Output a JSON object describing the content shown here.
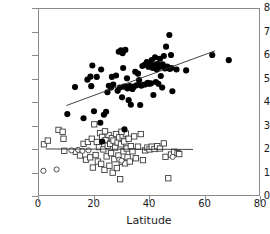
{
  "chart_data": {
    "type": "scatter",
    "title": "",
    "xlabel": "Latitude",
    "ylabel": "Ln (Torpor bout duration, h)",
    "xlim": [
      0,
      80
    ],
    "ylim": [
      0,
      8
    ],
    "xticks": [
      0,
      20,
      40,
      60,
      80
    ],
    "yticks": [
      0,
      1,
      2,
      3,
      4,
      5,
      6,
      7,
      8
    ],
    "grid": false,
    "legend": "none",
    "series": [
      {
        "name": "filled-circles",
        "marker": "filled-circle",
        "color": "#000000",
        "points": [
          [
            10.3,
            3.48
          ],
          [
            13.1,
            4.64
          ],
          [
            16.2,
            3.3
          ],
          [
            17.6,
            4.96
          ],
          [
            18.7,
            5.09
          ],
          [
            19.0,
            4.68
          ],
          [
            19.4,
            5.57
          ],
          [
            20.0,
            3.6
          ],
          [
            21.0,
            5.08
          ],
          [
            22.3,
            3.11
          ],
          [
            23.6,
            3.45
          ],
          [
            24.4,
            3.58
          ],
          [
            24.9,
            4.42
          ],
          [
            25.4,
            4.7
          ],
          [
            26.2,
            4.62
          ],
          [
            27.0,
            4.75
          ],
          [
            28.0,
            5.14
          ],
          [
            28.6,
            4.48
          ],
          [
            29.0,
            6.16
          ],
          [
            29.4,
            4.62
          ],
          [
            29.8,
            6.22
          ],
          [
            30.2,
            4.2
          ],
          [
            30.4,
            6.1
          ],
          [
            30.6,
            5.46
          ],
          [
            30.9,
            4.66
          ],
          [
            31.1,
            2.82
          ],
          [
            31.4,
            6.24
          ],
          [
            31.8,
            4.65
          ],
          [
            32.0,
            5.02
          ],
          [
            32.2,
            4.58
          ],
          [
            32.6,
            4.08
          ],
          [
            33.0,
            4.69
          ],
          [
            33.5,
            4.6
          ],
          [
            34.0,
            4.56
          ],
          [
            34.5,
            4.66
          ],
          [
            35.0,
            5.3
          ],
          [
            35.5,
            4.72
          ],
          [
            36.0,
            5.22
          ],
          [
            36.4,
            4.94
          ],
          [
            36.8,
            3.87
          ],
          [
            37.2,
            4.7
          ],
          [
            37.6,
            5.55
          ],
          [
            38.0,
            4.74
          ],
          [
            38.4,
            5.6
          ],
          [
            38.8,
            4.76
          ],
          [
            39.2,
            5.72
          ],
          [
            39.5,
            4.82
          ],
          [
            39.8,
            5.52
          ],
          [
            40.1,
            4.78
          ],
          [
            40.4,
            5.66
          ],
          [
            40.7,
            4.8
          ],
          [
            41.0,
            5.8
          ],
          [
            41.3,
            5.46
          ],
          [
            41.6,
            4.3
          ],
          [
            41.9,
            5.58
          ],
          [
            42.2,
            5.92
          ],
          [
            42.5,
            4.86
          ],
          [
            42.8,
            5.4
          ],
          [
            43.1,
            5.64
          ],
          [
            43.4,
            4.78
          ],
          [
            43.7,
            5.5
          ],
          [
            44.0,
            5.86
          ],
          [
            44.3,
            5.12
          ],
          [
            44.6,
            5.56
          ],
          [
            45.0,
            5.62
          ],
          [
            45.4,
            5.98
          ],
          [
            45.8,
            5.44
          ],
          [
            46.2,
            6.38
          ],
          [
            46.6,
            5.52
          ],
          [
            47.0,
            5.48
          ],
          [
            47.4,
            6.88
          ],
          [
            47.6,
            5.42
          ],
          [
            48.0,
            6.02
          ],
          [
            48.2,
            5.46
          ],
          [
            48.5,
            4.46
          ],
          [
            50.0,
            5.4
          ],
          [
            53.5,
            5.36
          ],
          [
            63.0,
            6.02
          ],
          [
            69.0,
            5.8
          ],
          [
            23.0,
            2.3
          ],
          [
            22.6,
            5.4
          ],
          [
            26.5,
            5.08
          ],
          [
            33.4,
            3.88
          ],
          [
            44.8,
            4.62
          ]
        ]
      },
      {
        "name": "open-squares",
        "marker": "open-square",
        "color": "#000000",
        "points": [
          [
            1.8,
            2.18
          ],
          [
            3.2,
            2.34
          ],
          [
            7.1,
            2.8
          ],
          [
            8.6,
            2.72
          ],
          [
            8.9,
            2.42
          ],
          [
            9.2,
            1.9
          ],
          [
            13.4,
            1.86
          ],
          [
            14.9,
            1.7
          ],
          [
            16.2,
            2.2
          ],
          [
            17.1,
            1.52
          ],
          [
            17.8,
            2.28
          ],
          [
            18.6,
            1.62
          ],
          [
            19.2,
            2.42
          ],
          [
            19.6,
            1.18
          ],
          [
            20.1,
            3.04
          ],
          [
            20.6,
            1.72
          ],
          [
            21.0,
            2.28
          ],
          [
            21.4,
            1.44
          ],
          [
            21.8,
            2.06
          ],
          [
            22.2,
            2.66
          ],
          [
            22.6,
            1.34
          ],
          [
            23.0,
            2.5
          ],
          [
            23.4,
            1.96
          ],
          [
            23.8,
            1.08
          ],
          [
            24.2,
            2.36
          ],
          [
            24.6,
            1.66
          ],
          [
            25.0,
            2.12
          ],
          [
            25.3,
            2.58
          ],
          [
            25.6,
            1.26
          ],
          [
            25.9,
            2.2
          ],
          [
            26.2,
            1.8
          ],
          [
            26.5,
            2.44
          ],
          [
            26.8,
            0.96
          ],
          [
            27.1,
            2.34
          ],
          [
            27.4,
            1.54
          ],
          [
            27.7,
            2.04
          ],
          [
            28.0,
            2.62
          ],
          [
            28.3,
            1.16
          ],
          [
            28.6,
            2.26
          ],
          [
            28.9,
            1.7
          ],
          [
            29.2,
            2.48
          ],
          [
            29.5,
            0.68
          ],
          [
            29.8,
            2.18
          ],
          [
            30.1,
            1.42
          ],
          [
            30.4,
            2.56
          ],
          [
            30.7,
            1.88
          ],
          [
            31.0,
            2.3
          ],
          [
            31.3,
            1.36
          ],
          [
            31.6,
            2.64
          ],
          [
            31.9,
            2.0
          ],
          [
            32.2,
            1.62
          ],
          [
            32.6,
            2.42
          ],
          [
            33.0,
            1.44
          ],
          [
            33.4,
            2.1
          ],
          [
            34.0,
            1.88
          ],
          [
            34.6,
            2.52
          ],
          [
            35.2,
            1.58
          ],
          [
            36.0,
            2.08
          ],
          [
            37.0,
            2.62
          ],
          [
            37.8,
            1.5
          ],
          [
            38.6,
            1.92
          ],
          [
            39.4,
            2.04
          ],
          [
            40.2,
            1.96
          ],
          [
            41.0,
            2.08
          ],
          [
            42.0,
            1.98
          ],
          [
            43.0,
            2.1
          ],
          [
            44.0,
            2.0
          ],
          [
            45.4,
            2.22
          ],
          [
            46.0,
            1.64
          ],
          [
            47.0,
            0.72
          ],
          [
            48.0,
            1.74
          ],
          [
            49.2,
            1.86
          ],
          [
            50.4,
            1.8
          ],
          [
            51.0,
            1.76
          ],
          [
            24.0,
            2.74
          ],
          [
            30.0,
            2.72
          ]
        ]
      },
      {
        "name": "open-circles",
        "marker": "open-circle",
        "color": "#000000",
        "points": [
          [
            1.6,
            1.04
          ],
          [
            6.4,
            1.1
          ],
          [
            11.8,
            1.92
          ],
          [
            14.2,
            1.94
          ],
          [
            15.8,
            1.9
          ],
          [
            18.0,
            1.92
          ],
          [
            29.2,
            1.52
          ],
          [
            30.0,
            1.48
          ],
          [
            48.6,
            1.64
          ]
        ]
      }
    ],
    "fit_lines": [
      {
        "name": "filled-circle-regression",
        "x0": 10.0,
        "y0": 3.85,
        "x1": 64.0,
        "y1": 6.2
      },
      {
        "name": "open-square-regression",
        "x0": 2.5,
        "y0": 1.98,
        "x1": 56.0,
        "y1": 1.96
      }
    ]
  }
}
